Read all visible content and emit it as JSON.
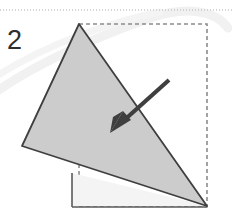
{
  "figure": {
    "kind": "origami-fold-diagram",
    "step_number": "2",
    "caption": "",
    "canvas": {
      "width": 232,
      "height": 216
    },
    "colors": {
      "page_background": "#ffffff",
      "flap_fill": "#cccccc",
      "base_fill": "#f4f4f4",
      "outline_stroke": "#404040",
      "dashed_guide_stroke": "#8c8c8c",
      "rule_stroke": "#c8c8c8",
      "arrow_fill": "#3f3f3f",
      "watermark_stroke": "#f2f2f2",
      "step_number_color": "#2e2e2e"
    },
    "top_rule": {
      "name": "page-separator-rule",
      "y": 10,
      "x1": 0,
      "x2": 232,
      "dash": "1 2"
    },
    "dashed_square": {
      "name": "fold-guide-square",
      "x": 79,
      "y": 24,
      "width": 128,
      "height": 182,
      "dash": "4 3"
    },
    "flap_triangle": {
      "name": "folded-flap",
      "points": "79,24 22,146 207,206",
      "fill": "#cccccc"
    },
    "base_shape": {
      "name": "base-sheet",
      "points": "72,173 207,206 72,206",
      "fill": "#f4f4f4"
    },
    "base_edges": [
      {
        "name": "base-left-edge",
        "x1": 72,
        "y1": 173,
        "x2": 72,
        "y2": 207
      },
      {
        "name": "base-bottom-edge",
        "x1": 72,
        "y1": 207,
        "x2": 207,
        "y2": 207
      }
    ],
    "fold_arrow": {
      "name": "fold-direction-arrow",
      "tail_x": 169,
      "tail_y": 80,
      "tip_x": 112,
      "tip_y": 131,
      "shaft_width": 4,
      "head_length": 17,
      "head_width": 13,
      "direction": "down-left"
    },
    "watermark": {
      "name": "background-watermark",
      "path": "M -10,96 C 40,60 105,34 150,18 C 186,6 215,10 228,28",
      "path2": "M 0,74 C 48,44 110,22 160,12"
    }
  }
}
